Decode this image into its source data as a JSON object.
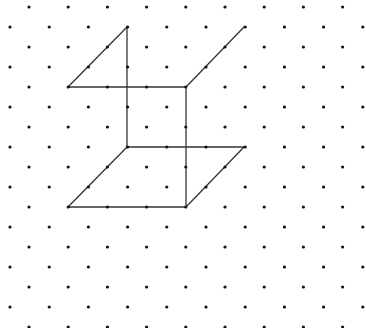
{
  "diagram": {
    "type": "isometric-dot-grid",
    "background": "#ffffff",
    "dot_color": "#111111",
    "dot_radius": 1.6,
    "line_color": "#333333",
    "line_width": 1.3,
    "grid": {
      "row_start_y": 7,
      "row_spacing": 20,
      "row_count": 17,
      "even_row_x_start": 29,
      "even_row_count": 9,
      "odd_row_x_start": 10,
      "odd_row_count": 10,
      "col_spacing": 39.2
    },
    "figures": [
      {
        "name": "upper-figure",
        "segments": [
          {
            "from": [
              127,
              27
            ],
            "to": [
              68,
              87
            ]
          },
          {
            "from": [
              127,
              27
            ],
            "to": [
              127,
              147
            ]
          },
          {
            "from": [
              68,
              87
            ],
            "to": [
              186,
              87
            ]
          },
          {
            "from": [
              186,
              87
            ],
            "to": [
              244,
              27
            ]
          },
          {
            "from": [
              186,
              87
            ],
            "to": [
              186,
              207
            ]
          }
        ]
      },
      {
        "name": "lower-parallelogram",
        "segments": [
          {
            "from": [
              127,
              147
            ],
            "to": [
              244,
              147
            ]
          },
          {
            "from": [
              244,
              147
            ],
            "to": [
              186,
              207
            ]
          },
          {
            "from": [
              186,
              207
            ],
            "to": [
              68,
              207
            ]
          },
          {
            "from": [
              68,
              207
            ],
            "to": [
              127,
              147
            ]
          }
        ]
      }
    ]
  }
}
